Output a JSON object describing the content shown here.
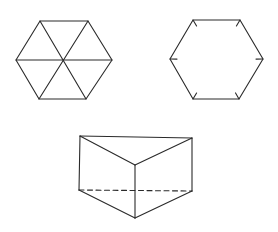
{
  "canvas": {
    "width": 278,
    "height": 232,
    "background": "#ffffff"
  },
  "style": {
    "stroke": "#2a2a2a",
    "stroke_width": 1.1,
    "dash": "5 3.5"
  },
  "figures": {
    "hexagon_triangulated": {
      "description": "Regular hexagon divided into six triangles by its three main diagonals",
      "vertices": [
        [
          40,
          21
        ],
        [
          88,
          21
        ],
        [
          112,
          60
        ],
        [
          86,
          99
        ],
        [
          39,
          99
        ],
        [
          16,
          60
        ]
      ],
      "center": [
        63,
        60
      ]
    },
    "hexagon_ticked": {
      "description": "Regular hexagon with short inward tick marks at each vertex",
      "vertices": [
        [
          193,
          20
        ],
        [
          240,
          20
        ],
        [
          263,
          59
        ],
        [
          239,
          99
        ],
        [
          193,
          99
        ],
        [
          170,
          59
        ]
      ],
      "center": [
        216.5,
        59.5
      ],
      "tick_length": 7
    },
    "triangular_prism": {
      "description": "Triangular prism with a hidden (dashed) back bottom edge",
      "top_face": [
        [
          80,
          136
        ],
        [
          192,
          138
        ],
        [
          135,
          165
        ]
      ],
      "bottom_face": [
        [
          79,
          190
        ],
        [
          192,
          191
        ],
        [
          135,
          218
        ]
      ],
      "hidden_edges": [
        [
          [
            79,
            190
          ],
          [
            192,
            191
          ]
        ]
      ]
    }
  }
}
